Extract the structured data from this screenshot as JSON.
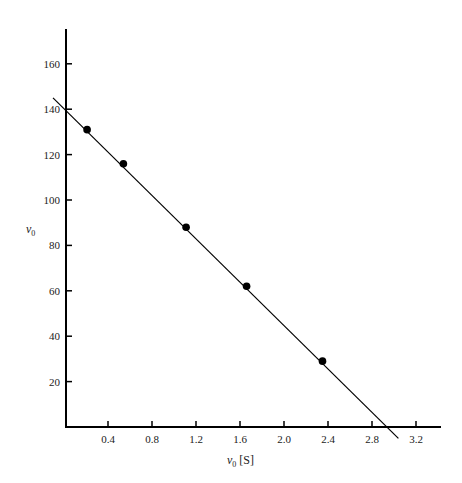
{
  "chart_data": {
    "type": "scatter",
    "title": "",
    "xlabel": "v0 [S]",
    "ylabel": "v0",
    "xlabel_parts": {
      "var": "v",
      "sub": "0",
      "unit": " [S]"
    },
    "ylabel_parts": {
      "var": "v",
      "sub": "0"
    },
    "xlim": [
      0,
      3.4
    ],
    "ylim": [
      0,
      175
    ],
    "x_ticks": [
      0.4,
      0.8,
      1.2,
      1.6,
      2.0,
      2.4,
      2.8,
      3.2
    ],
    "x_tick_labels": [
      "0.4",
      "0.8",
      "1.2",
      "1.6",
      "2.0",
      "2.4",
      "2.8",
      "3.2"
    ],
    "y_ticks": [
      20,
      40,
      60,
      80,
      100,
      120,
      140,
      160
    ],
    "y_tick_labels": [
      "20",
      "40",
      "60",
      "80",
      "100",
      "120",
      "140",
      "160"
    ],
    "grid": false,
    "legend": null,
    "series": [
      {
        "name": "measured points",
        "type": "scatter",
        "marker": "filled-circle",
        "color": "#000000",
        "x": [
          0.21,
          0.54,
          1.11,
          1.66,
          2.35
        ],
        "y": [
          131,
          116,
          88,
          62,
          29
        ]
      },
      {
        "name": "fitted line",
        "type": "line",
        "color": "#000000",
        "x": [
          -0.1,
          3.04
        ],
        "y": [
          145,
          -5
        ]
      }
    ]
  }
}
